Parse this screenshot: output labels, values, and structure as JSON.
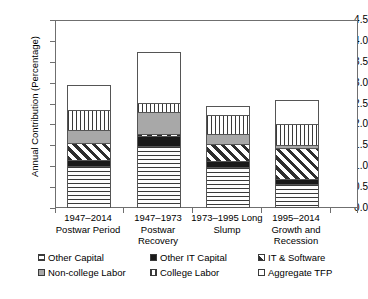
{
  "chart_data": {
    "type": "bar",
    "subtype": "stacked-bar",
    "title": "",
    "xlabel": "",
    "ylabel": "Annual Contribution (Percentage)",
    "ylim": [
      0.0,
      4.5
    ],
    "ytick_labels": [
      "0.0",
      "0.5",
      "1.0",
      "1.5",
      "2.0",
      "2.5",
      "3.0",
      "3.5",
      "4.0",
      "4.5"
    ],
    "ytick_values": [
      0.0,
      0.5,
      1.0,
      1.5,
      2.0,
      2.5,
      3.0,
      3.5,
      4.0,
      4.5
    ],
    "grid": false,
    "legend_position": "bottom",
    "categories": [
      "1947–2014 Postwar Period",
      "1947–1973 Postwar Recovery",
      "1973–1995 Long Slump",
      "1995–2014 Growth and Recession"
    ],
    "category_lines": [
      [
        "1947–2014",
        "Postwar Period"
      ],
      [
        "1947–1973",
        "Postwar",
        "Recovery"
      ],
      [
        "1973–1995 Long",
        "Slump"
      ],
      [
        "1995–2014",
        "Growth and",
        "Recession"
      ]
    ],
    "series": [
      {
        "name": "Other Capital",
        "pattern": "horizontal-lines",
        "values": [
          1.0,
          1.48,
          0.98,
          0.57
        ]
      },
      {
        "name": "Other IT Capital",
        "pattern": "solid-black",
        "values": [
          0.17,
          0.26,
          0.16,
          0.16
        ]
      },
      {
        "name": "IT & Software",
        "pattern": "diagonal-hatch",
        "values": [
          0.44,
          0.09,
          0.43,
          0.75
        ]
      },
      {
        "name": "Non-college Labor",
        "pattern": "solid-gray",
        "values": [
          0.33,
          0.55,
          0.27,
          0.1
        ]
      },
      {
        "name": "College Labor",
        "pattern": "vertical-lines",
        "values": [
          0.5,
          0.23,
          0.48,
          0.52
        ]
      },
      {
        "name": "Aggregate TFP",
        "pattern": "white",
        "values": [
          0.62,
          1.25,
          0.25,
          0.61
        ]
      }
    ],
    "totals": [
      3.06,
      3.86,
      2.57,
      2.71
    ]
  },
  "legend": {
    "items": [
      {
        "label": "Other Capital",
        "pattern": "horizontal-lines"
      },
      {
        "label": "Other IT Capital",
        "pattern": "solid-black"
      },
      {
        "label": "IT & Software",
        "pattern": "diagonal-hatch"
      },
      {
        "label": "Non-college Labor",
        "pattern": "solid-gray"
      },
      {
        "label": "College Labor",
        "pattern": "vertical-lines"
      },
      {
        "label": "Aggregate TFP",
        "pattern": "white"
      }
    ]
  },
  "colors": {
    "axis": "#6f6f6f",
    "ink": "#000000",
    "gray_fill": "#a8a8a8",
    "black_fill": "#1a1a1a",
    "background": "#ffffff"
  }
}
